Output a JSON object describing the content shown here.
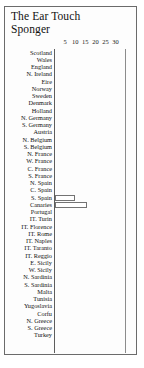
{
  "figure": {
    "title_lines": [
      "The Ear Touch",
      "Sponger"
    ]
  },
  "chart_data": {
    "type": "bar",
    "orientation": "horizontal",
    "title": "The Ear Touch Sponger",
    "xlabel": "",
    "ylabel": "",
    "xlim": [
      0,
      32
    ],
    "grid": false,
    "legend": null,
    "xticks": [
      5,
      10,
      15,
      20,
      25,
      30
    ],
    "categories": [
      "Scotland",
      "Wales",
      "England",
      "N. Ireland",
      "Eire",
      "Norway",
      "Sweden",
      "Denmark",
      "Holland",
      "N. Germany",
      "S. Germany",
      "Austria",
      "N. Belgium",
      "S. Belgium",
      "N. France",
      "W. France",
      "C. France",
      "S. France",
      "N. Spain",
      "C. Spain",
      "S. Spain",
      "Canaries",
      "Portugal",
      "IT. Turin",
      "IT. Florence",
      "IT. Rome",
      "IT. Naples",
      "IT. Taranto",
      "IT. Reggio",
      "E. Sicily",
      "W. Sicily",
      "N. Sardinia",
      "S. Sardinia",
      "Malta",
      "Tunisia",
      "Yugoslavia",
      "Corfu",
      "N. Greece",
      "S. Greece",
      "Turkey"
    ],
    "values": [
      0,
      0,
      0,
      0,
      0,
      0,
      0,
      0,
      0,
      0,
      0,
      0,
      0,
      0,
      0,
      0,
      0,
      0,
      0,
      0,
      10,
      16,
      0,
      0,
      0,
      0,
      0,
      0,
      0,
      0,
      0,
      0,
      0,
      0,
      0,
      0,
      0,
      0,
      0,
      0
    ]
  }
}
